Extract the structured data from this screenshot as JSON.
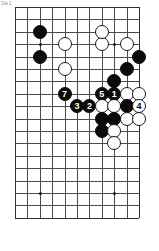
{
  "figure": {
    "corner_mark": "Dia 1",
    "board": {
      "size": 19,
      "visible_columns": 11,
      "visible_rows": 18,
      "line_color": "#4a4a4a",
      "edge_color": "#2f2f2f",
      "background_color": "#ffffff",
      "black_color": "#0b0b0b",
      "white_color": "#ffffff"
    }
  },
  "board_state": {
    "star_points": [
      {
        "col": 2,
        "row": 3
      },
      {
        "col": 8,
        "row": 3
      },
      {
        "col": 2,
        "row": 15
      },
      {
        "col": 8,
        "row": 15
      }
    ],
    "stones": [
      {
        "col": 2,
        "row": 2,
        "color": "black",
        "label": ""
      },
      {
        "col": 2,
        "row": 4,
        "color": "black",
        "label": ""
      },
      {
        "col": 4,
        "row": 3,
        "color": "white",
        "label": ""
      },
      {
        "col": 4,
        "row": 5,
        "color": "white",
        "label": ""
      },
      {
        "col": 7,
        "row": 3,
        "color": "white",
        "label": ""
      },
      {
        "col": 7,
        "row": 2,
        "color": "white",
        "label": ""
      },
      {
        "col": 9,
        "row": 3,
        "color": "white",
        "label": ""
      },
      {
        "col": 10,
        "row": 4,
        "color": "black",
        "label": ""
      },
      {
        "col": 9,
        "row": 5,
        "color": "black",
        "label": ""
      },
      {
        "col": 8,
        "row": 6,
        "color": "black",
        "label": ""
      },
      {
        "col": 4,
        "row": 7,
        "color": "black",
        "label": "7"
      },
      {
        "col": 7,
        "row": 7,
        "color": "black",
        "label": "5"
      },
      {
        "col": 8,
        "row": 7,
        "color": "black",
        "label": "1"
      },
      {
        "col": 9,
        "row": 7,
        "color": "white",
        "label": ""
      },
      {
        "col": 10,
        "row": 7,
        "color": "white",
        "label": ""
      },
      {
        "col": 5,
        "row": 8,
        "color": "black",
        "label": "3"
      },
      {
        "col": 6,
        "row": 8,
        "color": "black",
        "label": "2"
      },
      {
        "col": 7,
        "row": 8,
        "color": "white",
        "label": ""
      },
      {
        "col": 8,
        "row": 8,
        "color": "white",
        "label": ""
      },
      {
        "col": 9,
        "row": 8,
        "color": "black",
        "label": ""
      },
      {
        "col": 10,
        "row": 8,
        "color": "white",
        "label": "4"
      },
      {
        "col": 7,
        "row": 9,
        "color": "black",
        "label": ""
      },
      {
        "col": 8,
        "row": 9,
        "color": "black",
        "label": ""
      },
      {
        "col": 9,
        "row": 9,
        "color": "white",
        "label": ""
      },
      {
        "col": 10,
        "row": 9,
        "color": "white",
        "label": ""
      },
      {
        "col": 7,
        "row": 10,
        "color": "black",
        "label": ""
      },
      {
        "col": 8,
        "row": 10,
        "color": "white",
        "label": ""
      },
      {
        "col": 8,
        "row": 11,
        "color": "white",
        "label": ""
      }
    ],
    "move_numbers": [
      "1",
      "2",
      "3",
      "4",
      "5",
      "7"
    ]
  }
}
